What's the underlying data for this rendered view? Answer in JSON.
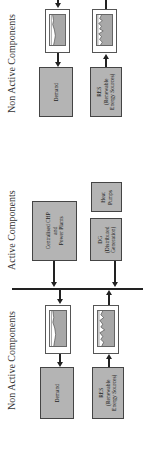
{
  "diagram": {
    "top_section": {
      "label": "Non Active Components",
      "demand": {
        "label": "Demand"
      },
      "res": {
        "line1": "RES",
        "line2": "(Renewable",
        "line3": "Energy Sources)"
      }
    },
    "active_section": {
      "label": "Active Components",
      "chp": {
        "line1": "Centralised CHP",
        "line2": "and",
        "line3": "Power Plants"
      },
      "dg": {
        "line1": "DG",
        "line2": "(Distributed",
        "line3": "Generation)"
      },
      "heat_pumps": {
        "line1": "Heat",
        "line2": "Pumps"
      }
    },
    "bottom_section": {
      "label": "Non Active Components",
      "demand": {
        "label": "Demand"
      },
      "res": {
        "line1": "RES",
        "line2": "(Renewable",
        "line3": "Energy Sources)"
      }
    },
    "colors": {
      "box_fill": "#b4b4b4",
      "line": "#222222",
      "background": "#ffffff"
    }
  }
}
